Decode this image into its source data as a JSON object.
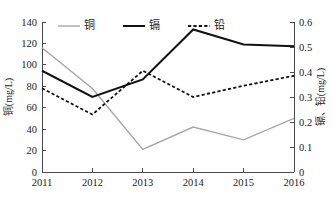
{
  "chart_data": {
    "type": "line",
    "title": "",
    "subtitle": "",
    "xlabel": "",
    "ylabel": "铜(mg/L)",
    "y2label": "镉、铅(mg/L)",
    "categories": [
      "2011",
      "2012",
      "2013",
      "2014",
      "2015",
      "2016"
    ],
    "x": [
      2011,
      2012,
      2013,
      2014,
      2015,
      2016
    ],
    "ylim": [
      0,
      140
    ],
    "y2lim": [
      0,
      0.6
    ],
    "yticks": [
      "0",
      "20",
      "40",
      "60",
      "80",
      "100",
      "120",
      "140"
    ],
    "ytick_values": [
      0,
      20,
      40,
      60,
      80,
      100,
      120,
      140
    ],
    "y2ticks": [
      "0",
      "0.1",
      "0.2",
      "0.3",
      "0.4",
      "0.5",
      "0.6"
    ],
    "y2tick_values": [
      0,
      0.1,
      0.2,
      0.3,
      0.4,
      0.5,
      0.6
    ],
    "grid": false,
    "legend_position": "top-center",
    "series": [
      {
        "name": "铜",
        "axis": "left",
        "style": "solid",
        "color": "#a6a6a6",
        "width": 1.4,
        "values": [
          116,
          78,
          21,
          42,
          30,
          50
        ]
      },
      {
        "name": "镉",
        "axis": "right",
        "style": "solid",
        "color": "#111111",
        "width": 2.0,
        "values": [
          0.405,
          0.3,
          0.37,
          0.57,
          0.51,
          0.503
        ]
      },
      {
        "name": "铅",
        "axis": "right",
        "style": "dotted",
        "color": "#111111",
        "width": 1.8,
        "values": [
          0.335,
          0.23,
          0.405,
          0.3,
          0.345,
          0.385
        ]
      }
    ],
    "annotations": []
  },
  "legend": {
    "items": [
      {
        "label": "铜"
      },
      {
        "label": "镉"
      },
      {
        "label": "铅"
      }
    ]
  },
  "axes": {
    "left_title": "铜(mg/L)",
    "right_title": "镉、铅(mg/L)"
  }
}
